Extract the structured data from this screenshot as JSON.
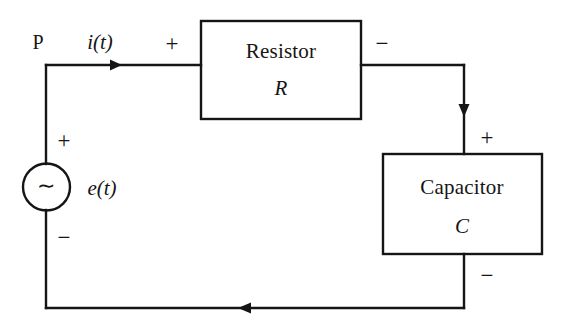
{
  "diagram": {
    "colors": {
      "background": "#ffffff",
      "ink": "#151515"
    },
    "nodes": {
      "node_p_label": "P"
    },
    "source": {
      "symbol": "∼",
      "symbol_name": "ac-source-tilde",
      "label": "e(t)",
      "polarity_top": "+",
      "polarity_bottom": "−"
    },
    "current": {
      "label": "i(t)",
      "direction": "right"
    },
    "blocks": [
      {
        "name": "resistor",
        "title": "Resistor",
        "symbol": "R",
        "terminal_left_sign": "+",
        "terminal_right_sign": "−"
      },
      {
        "name": "capacitor",
        "title": "Capacitor",
        "symbol": "C",
        "terminal_top_sign": "+",
        "terminal_bottom_sign": "−"
      }
    ]
  }
}
